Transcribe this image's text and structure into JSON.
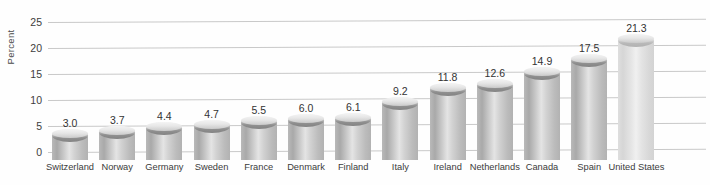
{
  "chart_data": {
    "type": "bar",
    "title": "",
    "subtitle": "",
    "xlabel": "",
    "ylabel": "Percent",
    "ylim": [
      0,
      25
    ],
    "yticks": [
      0,
      5,
      10,
      15,
      20,
      25
    ],
    "ytick_labels": [
      "0",
      "5",
      "10",
      "15",
      "20",
      "25"
    ],
    "grid": true,
    "legend": false,
    "legend_position": "none",
    "data_labels": true,
    "categories": [
      "Switzerland",
      "Norway",
      "Germany",
      "Sweden",
      "France",
      "Denmark",
      "Finland",
      "Italy",
      "Ireland",
      "Netherlands",
      "Canada",
      "Spain",
      "United States"
    ],
    "values": [
      3.0,
      3.7,
      4.4,
      4.7,
      5.5,
      6.0,
      6.1,
      9.2,
      11.8,
      12.6,
      14.9,
      17.5,
      21.3
    ],
    "value_labels": [
      "3.0",
      "3.7",
      "4.4",
      "4.7",
      "5.5",
      "6.0",
      "6.1",
      "9.2",
      "11.8",
      "12.6",
      "14.9",
      "17.5",
      "21.3"
    ],
    "bar_style": "3d-cylinder",
    "colors": {
      "bar_fill": "#c6c6c6",
      "bar_fill_highlight": "#e4e4e4",
      "bar_fill_shadow": "#a9a9a9",
      "bar_fill_light": "#e6e6e6",
      "gridline": "#c9c9c9",
      "text": "#3d3d3d",
      "background": "#fefefe"
    }
  }
}
